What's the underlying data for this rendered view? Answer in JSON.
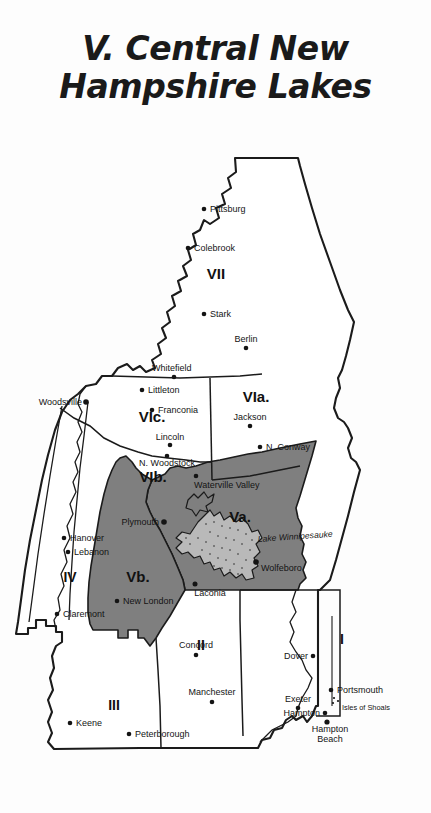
{
  "title": {
    "line1": "V. Central New",
    "line2": "Hampshire Lakes"
  },
  "colors": {
    "shaded_region": "#7f7f7f",
    "background": "#fdfdfd",
    "outline": "#1b1b1b",
    "text": "#141414"
  },
  "map": {
    "name": "New Hampshire regions map",
    "regions": [
      {
        "id": "VII",
        "label": "VII",
        "shaded": false
      },
      {
        "id": "VIa",
        "label": "VIa.",
        "shaded": false
      },
      {
        "id": "VIb",
        "label": "VIb.",
        "shaded": false
      },
      {
        "id": "VIc",
        "label": "VIc.",
        "shaded": false
      },
      {
        "id": "Va",
        "label": "Va.",
        "shaded": true
      },
      {
        "id": "Vb",
        "label": "Vb.",
        "shaded": true
      },
      {
        "id": "IV",
        "label": "IV",
        "shaded": false
      },
      {
        "id": "III",
        "label": "III",
        "shaded": false
      },
      {
        "id": "II",
        "label": "II",
        "shaded": false
      },
      {
        "id": "I",
        "label": "I",
        "shaded": false
      }
    ],
    "cities": [
      {
        "name": "Pittsburg",
        "region": "VII"
      },
      {
        "name": "Colebrook",
        "region": "VII"
      },
      {
        "name": "Stark",
        "region": "VII"
      },
      {
        "name": "Berlin",
        "region": "VII"
      },
      {
        "name": "Whitefield",
        "region": "VIc"
      },
      {
        "name": "Littleton",
        "region": "VIc"
      },
      {
        "name": "Franconia",
        "region": "VIc"
      },
      {
        "name": "Lincoln",
        "region": "VIc"
      },
      {
        "name": "N. Woodstock",
        "region": "VIb"
      },
      {
        "name": "Woodsville",
        "region": "VIc"
      },
      {
        "name": "Jackson",
        "region": "VIa"
      },
      {
        "name": "N. Conway",
        "region": "VIa"
      },
      {
        "name": "Waterville Valley",
        "region": "VIb"
      },
      {
        "name": "Plymouth",
        "region": "Vb"
      },
      {
        "name": "Laconia",
        "region": "Va"
      },
      {
        "name": "Wolfeboro",
        "region": "Va"
      },
      {
        "name": "Hanover",
        "region": "IV"
      },
      {
        "name": "Lebanon",
        "region": "IV"
      },
      {
        "name": "Claremont",
        "region": "IV"
      },
      {
        "name": "New London",
        "region": "Vb"
      },
      {
        "name": "Concord",
        "region": "II"
      },
      {
        "name": "Manchester",
        "region": "II"
      },
      {
        "name": "Keene",
        "region": "III"
      },
      {
        "name": "Peterborough",
        "region": "III"
      },
      {
        "name": "Dover",
        "region": "I"
      },
      {
        "name": "Portsmouth",
        "region": "I"
      },
      {
        "name": "Exeter",
        "region": "I"
      },
      {
        "name": "Hampton",
        "region": "I"
      },
      {
        "name": "Hampton Beach",
        "region": "I"
      },
      {
        "name": "Isles of Shoals",
        "region": "I"
      }
    ],
    "water_features": [
      {
        "name": "Lake Winnipesauke"
      }
    ],
    "labels": {
      "city_pittsburg": "Pittsburg",
      "city_colebrook": "Colebrook",
      "city_stark": "Stark",
      "city_berlin": "Berlin",
      "city_whitefield": "Whitefield",
      "city_littleton": "Littleton",
      "city_franconia": "Franconia",
      "city_lincoln": "Lincoln",
      "city_n_woodstock": "N. Woodstock",
      "city_woodsville": "Woodsville",
      "city_jackson": "Jackson",
      "city_n_conway": "N. Conway",
      "city_waterville_valley": "Waterville Valley",
      "city_plymouth": "Plymouth",
      "city_laconia": "Laconia",
      "city_wolfeboro": "Wolfeboro",
      "city_hanover": "Hanover",
      "city_lebanon": "Lebanon",
      "city_claremont": "Claremont",
      "city_new_london": "New London",
      "city_concord": "Concord",
      "city_manchester": "Manchester",
      "city_keene": "Keene",
      "city_peterborough": "Peterborough",
      "city_dover": "Dover",
      "city_portsmouth": "Portsmouth",
      "city_exeter": "Exeter",
      "city_hampton": "Hampton",
      "city_hampton_beach_1": "Hampton",
      "city_hampton_beach_2": "Beach",
      "city_isles_of_shoals": "Isles of Shoals",
      "lake_winnipesauke": "Lake Winnipesauke",
      "region_vii": "VII",
      "region_via": "VIa.",
      "region_vib": "VIb.",
      "region_vic": "VIc.",
      "region_va": "Va.",
      "region_vb": "Vb.",
      "region_iv": "IV",
      "region_iii": "III",
      "region_ii": "II",
      "region_i": "I"
    }
  }
}
